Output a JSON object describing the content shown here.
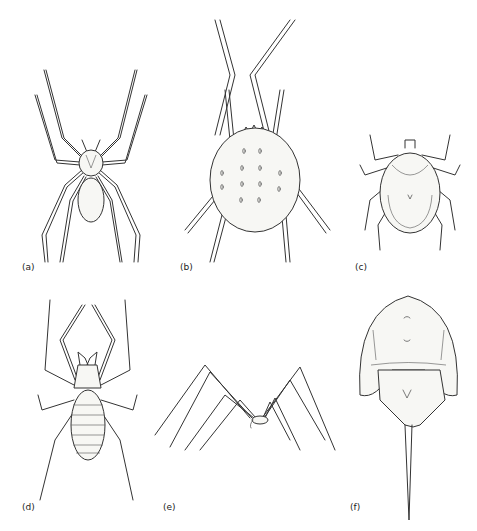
{
  "figure": {
    "panels": [
      {
        "id": "a",
        "label": "(a)",
        "subject": "spider"
      },
      {
        "id": "b",
        "label": "(b)",
        "subject": "mite"
      },
      {
        "id": "c",
        "label": "(c)",
        "subject": "tick"
      },
      {
        "id": "d",
        "label": "(d)",
        "subject": "solifuge (sun spider)"
      },
      {
        "id": "e",
        "label": "(e)",
        "subject": "harvestman (daddy longlegs)"
      },
      {
        "id": "f",
        "label": "(f)",
        "subject": "horseshoe crab"
      }
    ],
    "colors": {
      "ink": "#333333",
      "background": "#ffffff"
    }
  }
}
